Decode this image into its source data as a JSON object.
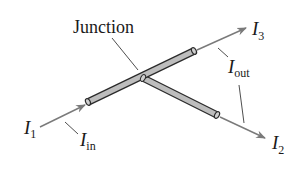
{
  "diagram": {
    "title_label": "Junction",
    "labels": {
      "i1": {
        "symbol": "I",
        "subscript": "1"
      },
      "i_in": {
        "symbol": "I",
        "subscript": "in"
      },
      "i2": {
        "symbol": "I",
        "subscript": "2"
      },
      "i3": {
        "symbol": "I",
        "subscript": "3"
      },
      "i_out": {
        "symbol": "I",
        "subscript": "out"
      }
    },
    "colors": {
      "wire_fill": "#bdbdbd",
      "wire_edge": "#2a2a2a",
      "arrow": "#7a7a7a",
      "leader": "#3a3a3a",
      "text": "#1a1a1a"
    }
  }
}
